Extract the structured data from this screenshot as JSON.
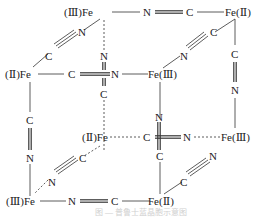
{
  "diagram": {
    "type": "Prussian blue unit cell (cubic cyanide-bridged iron lattice)",
    "nodes": {
      "back_top_left": "(Ⅲ)Fe",
      "back_top_right": "Fe(Ⅱ)",
      "front_top_left": "(Ⅱ)Fe",
      "front_top_right": "Fe(Ⅲ)",
      "back_bottom_left": "(Ⅱ)Fe",
      "back_bottom_right": "Fe(Ⅲ)",
      "front_bottom_left": "(Ⅲ)Fe",
      "front_bottom_right": "Fe(Ⅱ)"
    },
    "atoms": {
      "C": "C",
      "N": "N"
    },
    "edges": [
      {
        "from": "back_top_left",
        "to": "back_top_right",
        "label": "N≡C",
        "style": "solid"
      },
      {
        "from": "back_top_left",
        "to": "front_top_left",
        "label": "N≡C",
        "style": "solid"
      },
      {
        "from": "back_top_left",
        "to": "back_bottom_left",
        "label": "N≡C",
        "style": "dashed"
      },
      {
        "from": "back_top_right",
        "to": "front_top_right",
        "label": "C≡N",
        "style": "solid"
      },
      {
        "from": "back_top_right",
        "to": "back_bottom_right",
        "label": "C≡N",
        "style": "solid"
      },
      {
        "from": "front_top_left",
        "to": "front_top_right",
        "label": "C≡N",
        "style": "solid"
      },
      {
        "from": "front_top_left",
        "to": "front_bottom_left",
        "label": "C≡N",
        "style": "solid"
      },
      {
        "from": "front_top_right",
        "to": "front_bottom_right",
        "label": "N≡C",
        "style": "solid"
      },
      {
        "from": "back_bottom_left",
        "to": "back_bottom_right",
        "label": "C≡N",
        "style": "dashed"
      },
      {
        "from": "back_bottom_left",
        "to": "front_bottom_left",
        "label": "C≡N",
        "style": "dashed"
      },
      {
        "from": "front_bottom_left",
        "to": "front_bottom_right",
        "label": "N≡C",
        "style": "solid"
      },
      {
        "from": "front_bottom_right",
        "to": "outward",
        "label": "C≡N",
        "style": "solid"
      }
    ],
    "caption": "图 — 普鲁士蓝晶胞示意图"
  }
}
